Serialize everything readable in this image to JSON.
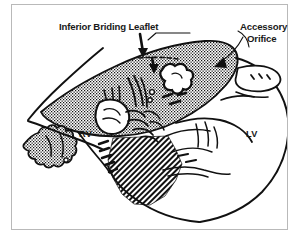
{
  "figure": {
    "kind": "medical-line-illustration",
    "background_color": "#ffffff",
    "ink_color": "#111111",
    "frame_color": "#b9b9b9",
    "stipple_fill": "dot-stipple",
    "hatch_fill": "diagonal-hatch"
  },
  "labels": {
    "inferior_bridging_leaflet": "Inferior Briding Leaflet",
    "accessory_orifice_line1": "Accessory",
    "accessory_orifice_line2": "Orifice",
    "right_ventricle": "RV",
    "left_ventricle": "LV"
  },
  "annotations": [
    {
      "name": "leaflet-arrow",
      "target": "inferior bridging leaflet",
      "direction": "down"
    },
    {
      "name": "orifice-arrow",
      "target": "accessory orifice",
      "direction": "down-left"
    }
  ],
  "regions": [
    {
      "name": "bridging-leaflet-mass",
      "texture": "stipple"
    },
    {
      "name": "rv-trabecular-blob",
      "texture": "stipple"
    },
    {
      "name": "septal-hatch-band",
      "texture": "hatch"
    },
    {
      "name": "lv-free-wall",
      "texture": "outline"
    }
  ]
}
